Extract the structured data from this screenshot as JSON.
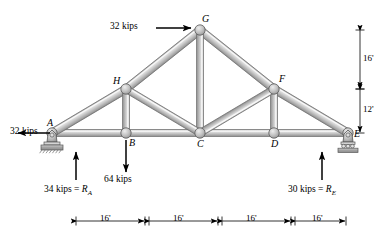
{
  "figure": {
    "units": "kips / feet"
  },
  "colors": {
    "member_fill": "#c9c9c9",
    "member_light": "#e8e8e8",
    "member_edge": "#6e6e6e",
    "joint_fill": "#c0c0c0",
    "joint_edge": "#5a5a5a",
    "ground": "#a8a8a8",
    "line": "#000000",
    "background": "#ffffff"
  },
  "joints": [
    {
      "name": "A",
      "label": "A",
      "x": 52,
      "y": 133,
      "label_dx": -5,
      "label_dy": -15
    },
    {
      "name": "B",
      "label": "B",
      "x": 126,
      "y": 133,
      "label_dx": 3,
      "label_dy": 5
    },
    {
      "name": "C",
      "label": "C",
      "x": 200,
      "y": 133,
      "label_dx": -3,
      "label_dy": 6
    },
    {
      "name": "D",
      "label": "D",
      "x": 274,
      "y": 133,
      "label_dx": -3,
      "label_dy": 6
    },
    {
      "name": "E",
      "label": "E",
      "x": 348,
      "y": 133,
      "label_dx": 6,
      "label_dy": -4
    },
    {
      "name": "F",
      "label": "F",
      "x": 274,
      "y": 89,
      "label_dx": 5,
      "label_dy": -15
    },
    {
      "name": "G",
      "label": "G",
      "x": 200,
      "y": 30,
      "label_dx": 2,
      "label_dy": -16
    },
    {
      "name": "H",
      "label": "H",
      "x": 126,
      "y": 89,
      "label_dx": -13,
      "label_dy": -13
    }
  ],
  "members": [
    {
      "name": "bottom-chord-AB",
      "from": "A",
      "to": "B",
      "width": 7
    },
    {
      "name": "bottom-chord-BC",
      "from": "B",
      "to": "C",
      "width": 7
    },
    {
      "name": "bottom-chord-CD",
      "from": "C",
      "to": "D",
      "width": 7
    },
    {
      "name": "bottom-chord-DE",
      "from": "D",
      "to": "E",
      "width": 7
    },
    {
      "name": "top-chord-AH",
      "from": "A",
      "to": "H",
      "width": 8
    },
    {
      "name": "top-chord-HG",
      "from": "H",
      "to": "G",
      "width": 8
    },
    {
      "name": "top-chord-GF",
      "from": "G",
      "to": "F",
      "width": 8
    },
    {
      "name": "top-chord-FE",
      "from": "F",
      "to": "E",
      "width": 8
    },
    {
      "name": "vertical-HB",
      "from": "H",
      "to": "B",
      "width": 7
    },
    {
      "name": "vertical-GC",
      "from": "G",
      "to": "C",
      "width": 7
    },
    {
      "name": "vertical-FD",
      "from": "F",
      "to": "D",
      "width": 7
    },
    {
      "name": "diagonal-HC",
      "from": "H",
      "to": "C",
      "width": 7
    },
    {
      "name": "diagonal-FC",
      "from": "F",
      "to": "C",
      "width": 7
    }
  ],
  "loads": [
    {
      "name": "load-at-G",
      "label": "32 kips",
      "magnitude": 32,
      "unit": "kips",
      "direction": "right",
      "at_joint": "G",
      "arrow": {
        "x1": 156,
        "y1": 28,
        "x2": 191,
        "y2": 28
      },
      "label_x": 110,
      "label_y": 22
    },
    {
      "name": "load-at-A",
      "label": "32 kips",
      "magnitude": 32,
      "unit": "kips",
      "direction": "left",
      "at_joint": "A",
      "arrow": {
        "x1": 50,
        "y1": 133,
        "x2": 18,
        "y2": 133
      },
      "label_x": 10,
      "label_y": 127
    },
    {
      "name": "load-at-B",
      "label": "64 kips",
      "magnitude": 64,
      "unit": "kips",
      "direction": "down",
      "at_joint": "B",
      "arrow": {
        "x1": 126,
        "y1": 140,
        "x2": 126,
        "y2": 172
      },
      "label_x": 104,
      "label_y": 175
    }
  ],
  "reactions": [
    {
      "name": "reaction-A",
      "value_text": "34 kips = ",
      "symbol": "R",
      "subscript": "A",
      "magnitude": 34,
      "unit": "kips",
      "direction": "up",
      "at_joint": "A",
      "arrow": {
        "x1": 76,
        "y1": 180,
        "x2": 76,
        "y2": 152
      },
      "label_x": 44,
      "label_y": 185
    },
    {
      "name": "reaction-E",
      "value_text": "30 kips = ",
      "symbol": "R",
      "subscript": "E",
      "magnitude": 30,
      "unit": "kips",
      "direction": "up",
      "at_joint": "E",
      "arrow": {
        "x1": 322,
        "y1": 180,
        "x2": 322,
        "y2": 152
      },
      "label_x": 288,
      "label_y": 185
    }
  ],
  "supports": [
    {
      "name": "pin-support-A",
      "type": "pin",
      "x": 52,
      "y": 133
    },
    {
      "name": "roller-support-E",
      "type": "roller",
      "x": 348,
      "y": 133
    }
  ],
  "dimensions": {
    "vertical": {
      "axis_x": 360,
      "entries": [
        {
          "name": "dim-vertical-upper",
          "label": "16'",
          "value": 16,
          "unit": "ft",
          "y_top": 30,
          "y_bottom": 89,
          "label_x": 363,
          "label_y": 54
        },
        {
          "name": "dim-vertical-lower",
          "label": "12'",
          "value": 12,
          "unit": "ft",
          "y_top": 89,
          "y_bottom": 133,
          "label_x": 363,
          "label_y": 105
        }
      ]
    },
    "horizontal": {
      "axis_y": 221,
      "entries": [
        {
          "name": "dim-bay-AB",
          "label": "16'",
          "value": 16,
          "unit": "ft",
          "x_left": 76,
          "x_right": 145,
          "label_x": 100,
          "label_y": 214
        },
        {
          "name": "dim-bay-BC",
          "label": "16'",
          "value": 16,
          "unit": "ft",
          "x_left": 149,
          "x_right": 218,
          "label_x": 173,
          "label_y": 214
        },
        {
          "name": "dim-bay-CD",
          "label": "16'",
          "value": 16,
          "unit": "ft",
          "x_left": 222,
          "x_right": 291,
          "label_x": 246,
          "label_y": 214
        },
        {
          "name": "dim-bay-DE",
          "label": "16'",
          "value": 16,
          "unit": "ft",
          "x_left": 295,
          "x_right": 346,
          "label_x": 312,
          "label_y": 214
        }
      ]
    }
  }
}
